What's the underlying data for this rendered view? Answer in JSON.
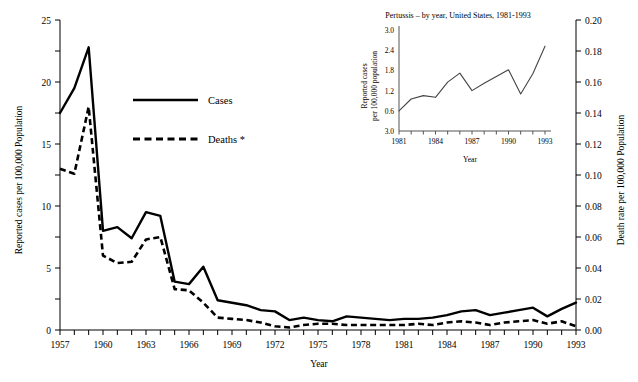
{
  "figure": {
    "background": "#ffffff",
    "line_color": "#000000"
  },
  "main": {
    "xlabel": "Year",
    "ylabel_left": "Reported cases per 100,000 Population",
    "ylabel_right": "Death rate per 100,000 Population",
    "x_ticks": [
      "1957",
      "1960",
      "1963",
      "1966",
      "1969",
      "1972",
      "1975",
      "1978",
      "1981",
      "1984",
      "1987",
      "1990",
      "1993"
    ],
    "y_ticks_left": [
      "0",
      "5",
      "10",
      "15",
      "20",
      "25"
    ],
    "y_ticks_right": [
      "0.00",
      "0.02",
      "0.04",
      "0.06",
      "0.08",
      "0.10",
      "0.12",
      "0.14",
      "0.16",
      "0.18",
      "0.20"
    ],
    "legend": [
      {
        "label": "Cases",
        "style": "solid"
      },
      {
        "label": "Deaths *",
        "style": "dashed"
      }
    ]
  },
  "inset": {
    "title": "Pertussis – by year, United States, 1981-1993",
    "xlabel": "Year",
    "ylabel": "Reported cases per 100,000 population",
    "x_ticks": [
      "1981",
      "1984",
      "1987",
      "1990",
      "1993"
    ],
    "y_ticks": [
      "3.0",
      "2.4",
      "1.8",
      "1.2",
      "0.6",
      "3.0"
    ]
  },
  "chart_data": [
    {
      "id": "main-chart",
      "type": "line",
      "title": "",
      "xlabel": "Year",
      "ylabel": "Reported cases per 100,000 Population",
      "ylabel_secondary": "Death rate per 100,000 Population",
      "xlim": [
        1957,
        1993
      ],
      "ylim": [
        0,
        25
      ],
      "ylim_secondary": [
        0.0,
        0.2
      ],
      "grid": false,
      "legend_position": "upper-center-left",
      "x": [
        1957,
        1958,
        1959,
        1960,
        1961,
        1962,
        1963,
        1964,
        1965,
        1966,
        1967,
        1968,
        1969,
        1970,
        1971,
        1972,
        1973,
        1974,
        1975,
        1976,
        1977,
        1978,
        1979,
        1980,
        1981,
        1982,
        1983,
        1984,
        1985,
        1986,
        1987,
        1988,
        1989,
        1990,
        1991,
        1992,
        1993
      ],
      "series": [
        {
          "name": "Cases",
          "style": "solid",
          "axis": "left",
          "units": "reported cases per 100,000 population",
          "values": [
            17.5,
            19.5,
            22.8,
            8.0,
            8.3,
            7.4,
            9.5,
            9.2,
            3.9,
            3.7,
            5.1,
            2.4,
            2.2,
            2.0,
            1.6,
            1.5,
            0.8,
            1.0,
            0.8,
            0.7,
            1.1,
            1.0,
            0.9,
            0.8,
            0.9,
            0.9,
            1.0,
            1.2,
            1.5,
            1.6,
            1.2,
            1.4,
            1.6,
            1.8,
            1.1,
            1.7,
            2.2
          ]
        },
        {
          "name": "Deaths *",
          "style": "dashed",
          "axis": "right",
          "units": "death rate per 100,000 population",
          "values_left_scale": [
            13.0,
            12.6,
            18.0,
            6.0,
            5.4,
            5.5,
            7.3,
            7.5,
            3.3,
            3.2,
            2.2,
            1.0,
            0.9,
            0.8,
            0.6,
            0.3,
            0.2,
            0.4,
            0.5,
            0.5,
            0.4,
            0.4,
            0.4,
            0.4,
            0.4,
            0.5,
            0.4,
            0.6,
            0.7,
            0.6,
            0.4,
            0.6,
            0.7,
            0.8,
            0.5,
            0.7,
            0.3
          ],
          "values": [
            0.104,
            0.101,
            0.144,
            0.048,
            0.043,
            0.044,
            0.058,
            0.06,
            0.026,
            0.026,
            0.018,
            0.008,
            0.007,
            0.006,
            0.005,
            0.002,
            0.002,
            0.003,
            0.004,
            0.004,
            0.003,
            0.003,
            0.003,
            0.003,
            0.003,
            0.004,
            0.003,
            0.005,
            0.006,
            0.005,
            0.003,
            0.005,
            0.006,
            0.006,
            0.004,
            0.006,
            0.002
          ]
        }
      ]
    },
    {
      "id": "inset-chart",
      "type": "line",
      "title": "Pertussis – by year, United States, 1981-1993",
      "xlabel": "Year",
      "ylabel": "Reported cases per 100,000 population",
      "xlim": [
        1981,
        1993
      ],
      "ylim": [
        0.0,
        3.0
      ],
      "grid": false,
      "x": [
        1981,
        1982,
        1983,
        1984,
        1985,
        1986,
        1987,
        1988,
        1989,
        1990,
        1991,
        1992,
        1993
      ],
      "series": [
        {
          "name": "Reported cases",
          "style": "solid",
          "values": [
            0.6,
            0.95,
            1.05,
            1.0,
            1.45,
            1.72,
            1.2,
            1.42,
            1.62,
            1.82,
            1.1,
            1.7,
            2.52
          ]
        }
      ]
    }
  ]
}
